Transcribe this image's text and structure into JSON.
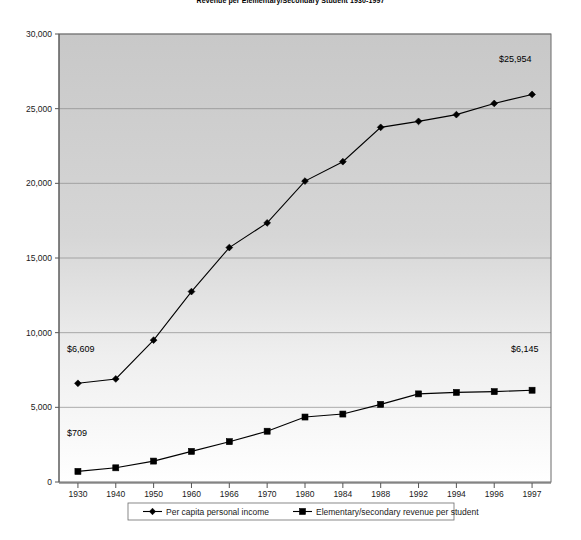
{
  "chart_data": {
    "type": "line",
    "title": "Revenue per Elementary/Secondary Student 1930-1997",
    "xlabel": "",
    "ylabel": "",
    "categories": [
      "1930",
      "1940",
      "1950",
      "1960",
      "1966",
      "1970",
      "1980",
      "1984",
      "1988",
      "1992",
      "1994",
      "1996",
      "1997"
    ],
    "ylim": [
      0,
      30000
    ],
    "yticks": [
      "0",
      "5,000",
      "10,000",
      "15,000",
      "20,000",
      "25,000",
      "30,000"
    ],
    "ytick_values": [
      0,
      5000,
      10000,
      15000,
      20000,
      25000,
      30000
    ],
    "grid": true,
    "legend_position": "bottom",
    "series": [
      {
        "name": "Per capita personal income",
        "marker": "diamond",
        "values": [
          6609,
          6900,
          9500,
          12750,
          15700,
          17350,
          20150,
          21450,
          23750,
          24150,
          24600,
          25350,
          25954
        ]
      },
      {
        "name": "Elementary/secondary revenue per student",
        "marker": "square",
        "values": [
          709,
          950,
          1400,
          2050,
          2700,
          3400,
          4350,
          4550,
          5200,
          5900,
          6000,
          6050,
          6145
        ]
      }
    ],
    "annotations": [
      {
        "text": "$6,609",
        "series": "Per capita personal income",
        "point": "1930"
      },
      {
        "text": "$709",
        "series": "Elementary/secondary revenue per student",
        "point": "1930"
      },
      {
        "text": "$25,954",
        "series": "Per capita personal income",
        "point": "1997"
      },
      {
        "text": "$6,145",
        "series": "Elementary/secondary revenue per student",
        "point": "1997"
      }
    ]
  },
  "legend": {
    "items": [
      {
        "label": "Per capita personal income",
        "marker": "diamond-marker-icon"
      },
      {
        "label": "Elementary/secondary revenue per student",
        "marker": "square-marker-icon"
      }
    ]
  }
}
